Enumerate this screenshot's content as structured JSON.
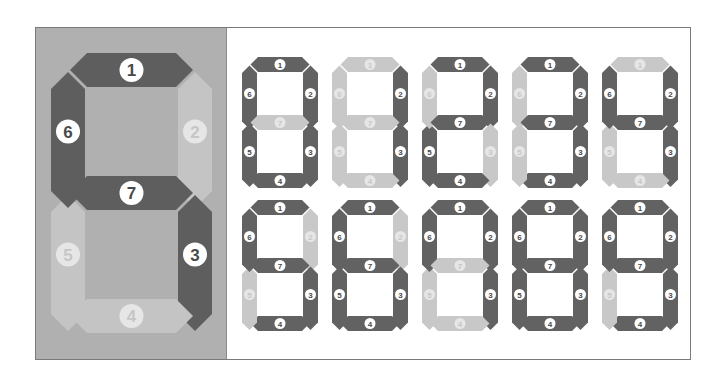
{
  "colors": {
    "panel_bg": "#b0b0b0",
    "seg_on": "#5e5e5e",
    "seg_off": "#c4c4c4",
    "small_on": "#626262",
    "small_off": "#c8c8c8",
    "badge_bg": "#ffffff",
    "badge_text_on": "#4a4a4a",
    "badge_text_off": "#c6c6c6"
  },
  "segment_labels": [
    "1",
    "2",
    "3",
    "4",
    "5",
    "6",
    "7"
  ],
  "large_display": {
    "title": "Seven-segment display segment numbering",
    "lit_segments": [
      1,
      3,
      6,
      7
    ]
  },
  "digits": [
    {
      "digit": "0",
      "lit_segments": [
        1,
        2,
        3,
        4,
        5,
        6
      ]
    },
    {
      "digit": "1",
      "lit_segments": [
        2,
        3
      ]
    },
    {
      "digit": "2",
      "lit_segments": [
        1,
        2,
        4,
        5,
        7
      ]
    },
    {
      "digit": "3",
      "lit_segments": [
        1,
        2,
        3,
        4,
        7
      ]
    },
    {
      "digit": "4",
      "lit_segments": [
        2,
        3,
        6,
        7
      ]
    },
    {
      "digit": "5",
      "lit_segments": [
        1,
        3,
        4,
        6,
        7
      ]
    },
    {
      "digit": "6",
      "lit_segments": [
        1,
        3,
        4,
        5,
        6,
        7
      ]
    },
    {
      "digit": "7",
      "lit_segments": [
        1,
        2,
        3,
        6
      ]
    },
    {
      "digit": "8",
      "lit_segments": [
        1,
        2,
        3,
        4,
        5,
        6,
        7
      ]
    },
    {
      "digit": "9",
      "lit_segments": [
        1,
        2,
        3,
        4,
        6,
        7
      ]
    }
  ]
}
